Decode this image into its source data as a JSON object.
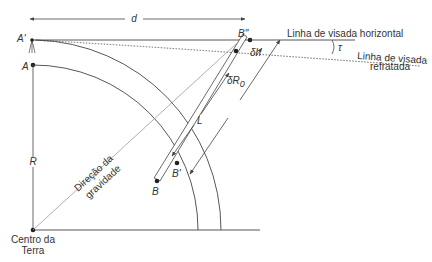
{
  "diagram": {
    "labels": {
      "d": "d",
      "A_prime": "A'",
      "A": "A",
      "R": "R",
      "B": "B",
      "B_prime": "B'",
      "B_double_prime": "B\"",
      "L": "L",
      "delta_h": "δh",
      "delta_R0": "δR",
      "delta_R0_sub": "0",
      "tau": "τ",
      "horizontal_sight_line": "Linha de visada horizontal",
      "refracted_sight_line_1": "Linha de visada",
      "refracted_sight_line_2": "refratada",
      "gravity_direction_1": "Direção da",
      "gravity_direction_2": "gravidade",
      "earth_center_1": "Centro da",
      "earth_center_2": "Terra"
    },
    "colors": {
      "line": "#444444",
      "light_line": "#999999",
      "point": "#222222"
    }
  }
}
